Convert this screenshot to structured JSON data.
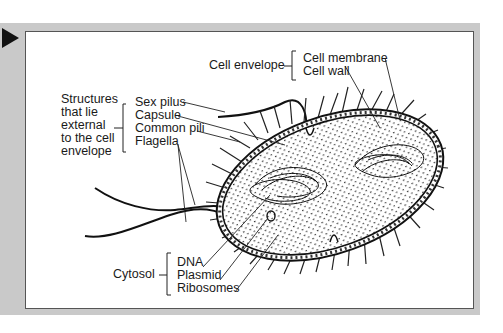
{
  "figure": {
    "type": "labeled diagram",
    "marker_icon": "play-triangle-icon"
  },
  "groups": {
    "external": {
      "heading_lines": [
        "Structures",
        "that lie",
        "external",
        "to the cell",
        "envelope"
      ],
      "items": [
        "Sex pilus",
        "Capsule",
        "Common pili",
        "Flagella"
      ]
    },
    "envelope": {
      "heading": "Cell envelope",
      "items": [
        "Cell membrane",
        "Cell wall"
      ]
    },
    "cytosol": {
      "heading": "Cytosol",
      "items": [
        "DNA",
        "Plasmid",
        "Ribosomes"
      ]
    }
  },
  "colors": {
    "frame_band": "#c9c9c9",
    "panel": "#ffffff",
    "ink": "#1a1a1a"
  }
}
